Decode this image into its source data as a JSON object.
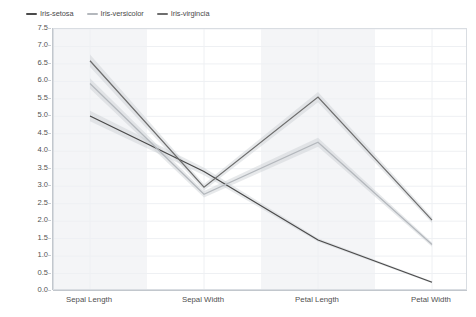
{
  "chart_data": {
    "type": "line",
    "title": "",
    "subtitle": "",
    "xlabel": "",
    "ylabel": "",
    "categories": [
      "Sepal Length",
      "Sepal Width",
      "Petal Length",
      "Petal Width"
    ],
    "ylim": [
      0.0,
      7.5
    ],
    "yticks": [
      "0.0",
      "0.5",
      "1.0",
      "1.5",
      "2.0",
      "2.5",
      "3.0",
      "3.5",
      "4.0",
      "4.5",
      "5.0",
      "5.5",
      "6.0",
      "6.5",
      "7.0",
      "7.5"
    ],
    "ytick_values": [
      0.0,
      0.5,
      1.0,
      1.5,
      2.0,
      2.5,
      3.0,
      3.5,
      4.0,
      4.5,
      5.0,
      5.5,
      6.0,
      6.5,
      7.0,
      7.5
    ],
    "grid": true,
    "grid_axis": "both",
    "legend_position": "top-left",
    "band_type": "confidence-interval",
    "series": [
      {
        "name": "Iris-setosa",
        "color": "#4a4a4a",
        "values": [
          5.01,
          3.42,
          1.46,
          0.25
        ],
        "band_lower": [
          4.86,
          3.31,
          1.41,
          0.22
        ],
        "band_upper": [
          5.16,
          3.53,
          1.51,
          0.28
        ]
      },
      {
        "name": "Iris-versicolor",
        "color": "#b4b8bd",
        "values": [
          5.94,
          2.77,
          4.26,
          1.33
        ],
        "band_lower": [
          5.79,
          2.68,
          4.13,
          1.27
        ],
        "band_upper": [
          6.09,
          2.86,
          4.39,
          1.39
        ]
      },
      {
        "name": "Iris-virgincia",
        "color": "#6e6e6e",
        "values": [
          6.59,
          2.97,
          5.55,
          2.03
        ],
        "band_lower": [
          6.41,
          2.88,
          5.4,
          1.95
        ],
        "band_upper": [
          6.77,
          3.06,
          5.7,
          2.11
        ]
      }
    ],
    "column_bands": [
      {
        "category": "Sepal Length",
        "shaded": true
      },
      {
        "category": "Sepal Width",
        "shaded": false
      },
      {
        "category": "Petal Length",
        "shaded": true
      },
      {
        "category": "Petal Width",
        "shaded": false
      }
    ]
  },
  "legend": {
    "items": [
      {
        "label": "Iris-setosa",
        "color": "#4a4a4a"
      },
      {
        "label": "Iris-versicolor",
        "color": "#b4b8bd"
      },
      {
        "label": "Iris-virgincia",
        "color": "#6e6e6e"
      }
    ]
  },
  "colors": {
    "plot_background": "#ffffff",
    "grid_line": "#eef0f3",
    "column_band": "#f4f5f7",
    "axis_line": "#c2c7cd",
    "frame_border": "#d9dde2",
    "confidence_band": "#c6cacf"
  }
}
